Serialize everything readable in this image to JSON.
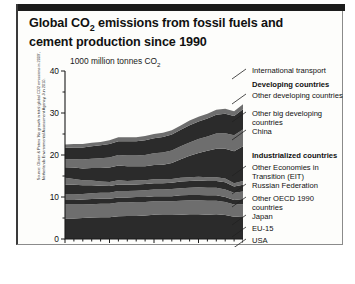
{
  "title": "Global CO2 emissions from fossil fuels and cement production since 1990",
  "title_part1": "Global CO",
  "title_sub": "2",
  "title_part2": " emissions from fossil fuels and cement production since 1990",
  "units_label": "1000 million tonnes CO",
  "units_sub": "2",
  "source": "Source: Olivier & Peters 'No growth in total global CO2 emissions in 2009', Netherlands Environmental Assessment Agency, Jun 2010.",
  "colors": {
    "header_bar": "#1c1c1c",
    "panel_bg": "#fdfdfb",
    "frame": "#8b8b8b",
    "band_dark": "#2b2b2b",
    "band_mid": "#6e6e6e",
    "axis": "#1a1a1a",
    "text": "#111111"
  },
  "chart_data": {
    "type": "area",
    "title": "Global CO2 emissions from fossil fuels and cement production since 1990",
    "xlabel": "",
    "ylabel": "1000 million tonnes CO2",
    "ylim": [
      0,
      40
    ],
    "xlim": [
      1990,
      2010
    ],
    "ytick_labels": [
      "0",
      "10",
      "20",
      "30",
      "40"
    ],
    "yticks": [
      0,
      10,
      20,
      30,
      40
    ],
    "xtick_labels": [
      "1990",
      "1995",
      "2000",
      "2005",
      "2010"
    ],
    "xticks": [
      1990,
      1995,
      2000,
      2005,
      2010
    ],
    "grid": false,
    "legend_position": "right",
    "stacked": true,
    "x": [
      1990,
      1991,
      1992,
      1993,
      1994,
      1995,
      1996,
      1997,
      1998,
      1999,
      2000,
      2001,
      2002,
      2003,
      2004,
      2005,
      2006,
      2007,
      2008,
      2009,
      2010
    ],
    "series": [
      {
        "name": "USA",
        "shade": "dark",
        "values": [
          4.9,
          4.9,
          5.0,
          5.1,
          5.2,
          5.2,
          5.4,
          5.5,
          5.5,
          5.6,
          5.8,
          5.7,
          5.7,
          5.8,
          5.9,
          5.9,
          5.8,
          5.9,
          5.7,
          5.3,
          5.4
        ]
      },
      {
        "name": "EU-15",
        "shade": "mid",
        "values": [
          3.3,
          3.3,
          3.2,
          3.2,
          3.2,
          3.2,
          3.3,
          3.2,
          3.3,
          3.2,
          3.2,
          3.3,
          3.3,
          3.3,
          3.3,
          3.3,
          3.3,
          3.2,
          3.1,
          2.9,
          2.9
        ]
      },
      {
        "name": "Japan",
        "shade": "dark",
        "values": [
          1.1,
          1.1,
          1.2,
          1.2,
          1.2,
          1.2,
          1.2,
          1.2,
          1.2,
          1.2,
          1.2,
          1.2,
          1.2,
          1.3,
          1.3,
          1.3,
          1.3,
          1.3,
          1.2,
          1.1,
          1.2
        ]
      },
      {
        "name": "Other OECD 1990 countries",
        "shade": "mid",
        "values": [
          1.3,
          1.3,
          1.3,
          1.4,
          1.4,
          1.4,
          1.5,
          1.5,
          1.5,
          1.6,
          1.6,
          1.6,
          1.7,
          1.7,
          1.7,
          1.8,
          1.8,
          1.8,
          1.8,
          1.7,
          1.8
        ]
      },
      {
        "name": "Russian Federation",
        "shade": "dark",
        "values": [
          2.4,
          2.3,
          2.1,
          1.9,
          1.7,
          1.6,
          1.6,
          1.5,
          1.5,
          1.5,
          1.5,
          1.5,
          1.5,
          1.6,
          1.6,
          1.6,
          1.6,
          1.6,
          1.7,
          1.5,
          1.6
        ]
      },
      {
        "name": "Other Economies in Transition (EIT)",
        "shade": "mid",
        "values": [
          1.6,
          1.4,
          1.2,
          1.1,
          1.0,
          1.0,
          1.0,
          0.9,
          0.9,
          0.9,
          0.9,
          0.9,
          0.9,
          0.9,
          0.9,
          0.9,
          0.9,
          0.9,
          0.9,
          0.8,
          0.9
        ]
      },
      {
        "name": "China",
        "shade": "dark",
        "values": [
          2.5,
          2.7,
          2.8,
          3.0,
          3.2,
          3.4,
          3.5,
          3.5,
          3.4,
          3.3,
          3.4,
          3.5,
          3.8,
          4.4,
          5.1,
          5.7,
          6.3,
          6.8,
          7.1,
          7.6,
          8.3
        ]
      },
      {
        "name": "Other big developing countries",
        "shade": "mid",
        "values": [
          1.9,
          2.0,
          2.1,
          2.2,
          2.3,
          2.4,
          2.5,
          2.6,
          2.6,
          2.7,
          2.8,
          2.9,
          3.0,
          3.1,
          3.2,
          3.3,
          3.4,
          3.6,
          3.7,
          3.8,
          4.0
        ]
      },
      {
        "name": "Other developing countries",
        "shade": "dark",
        "values": [
          2.7,
          2.8,
          2.9,
          3.0,
          3.1,
          3.2,
          3.3,
          3.4,
          3.4,
          3.5,
          3.6,
          3.7,
          3.8,
          3.9,
          4.1,
          4.2,
          4.3,
          4.5,
          4.6,
          4.6,
          4.8
        ]
      },
      {
        "name": "International transport",
        "shade": "mid",
        "values": [
          0.8,
          0.8,
          0.8,
          0.8,
          0.8,
          0.9,
          0.9,
          0.9,
          0.9,
          1.0,
          1.0,
          1.0,
          1.0,
          1.0,
          1.1,
          1.1,
          1.1,
          1.2,
          1.2,
          1.1,
          1.2
        ]
      }
    ]
  },
  "legend": {
    "items": [
      {
        "label": "International transport",
        "bold": false,
        "top": 0
      },
      {
        "label": "Developing countries",
        "bold": true,
        "top": 14
      },
      {
        "label": "Other developing countries",
        "bold": false,
        "top": 25
      },
      {
        "label": "Other big developing countries",
        "bold": false,
        "top": 43
      },
      {
        "label": "China",
        "bold": false,
        "top": 61
      },
      {
        "label": "Industrialized countries",
        "bold": true,
        "top": 85
      },
      {
        "label": "Other Economies in Transition (EIT)",
        "bold": false,
        "top": 97
      },
      {
        "label": "Russian Federation",
        "bold": false,
        "top": 115
      },
      {
        "label": "Other OECD 1990 countries",
        "bold": false,
        "top": 128
      },
      {
        "label": "Japan",
        "bold": false,
        "top": 146
      },
      {
        "label": "EU-15",
        "bold": false,
        "top": 158
      },
      {
        "label": "USA",
        "bold": false,
        "top": 170
      }
    ]
  }
}
